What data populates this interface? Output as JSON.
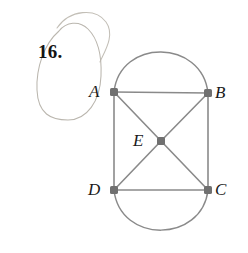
{
  "figure": {
    "problem_number": "16.",
    "vertices": [
      {
        "id": "A",
        "label": "A",
        "x": 114,
        "y": 92,
        "label_x": 89,
        "label_y": 83
      },
      {
        "id": "B",
        "label": "B",
        "x": 208,
        "y": 93,
        "label_x": 215,
        "label_y": 84
      },
      {
        "id": "E",
        "label": "E",
        "x": 161,
        "y": 141,
        "label_x": 133,
        "label_y": 132
      },
      {
        "id": "D",
        "label": "D",
        "x": 114,
        "y": 190,
        "label_x": 88,
        "label_y": 181
      },
      {
        "id": "C",
        "label": "C",
        "x": 208,
        "y": 190,
        "label_x": 215,
        "label_y": 181
      }
    ],
    "straight_edges": [
      {
        "from": "A",
        "to": "B"
      },
      {
        "from": "A",
        "to": "D"
      },
      {
        "from": "B",
        "to": "C"
      },
      {
        "from": "D",
        "to": "C"
      },
      {
        "from": "A",
        "to": "E"
      },
      {
        "from": "B",
        "to": "E"
      },
      {
        "from": "D",
        "to": "E"
      },
      {
        "from": "C",
        "to": "E"
      }
    ],
    "curved_edges": [
      {
        "from": "A",
        "to": "B",
        "side": "top",
        "apex_y": 45
      },
      {
        "from": "D",
        "to": "C",
        "side": "bottom",
        "apex_y": 237
      }
    ],
    "colors": {
      "edge": "#8a8a8a",
      "vertex": "#707070",
      "label": "#1a1a1a",
      "annotation_oval": "#b9b5ad",
      "background": "#ffffff"
    }
  }
}
